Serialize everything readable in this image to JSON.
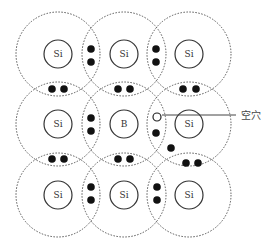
{
  "diagram": {
    "type": "boron-doped silicon lattice (P-type semiconductor)",
    "colors": {
      "background": "#ffffff",
      "line": "#333333",
      "dotted": "#555555",
      "electron": "#111111"
    },
    "atoms": [
      {
        "row": 0,
        "col": 0,
        "label": "Si",
        "x": 58,
        "y": 54
      },
      {
        "row": 0,
        "col": 1,
        "label": "Si",
        "x": 124,
        "y": 54
      },
      {
        "row": 0,
        "col": 2,
        "label": "Si",
        "x": 189,
        "y": 54
      },
      {
        "row": 1,
        "col": 0,
        "label": "Si",
        "x": 58,
        "y": 124
      },
      {
        "row": 1,
        "col": 1,
        "label": "B",
        "x": 124,
        "y": 124
      },
      {
        "row": 1,
        "col": 2,
        "label": "Si",
        "x": 189,
        "y": 124
      },
      {
        "row": 2,
        "col": 0,
        "label": "Si",
        "x": 58,
        "y": 195
      },
      {
        "row": 2,
        "col": 1,
        "label": "Si",
        "x": 124,
        "y": 195
      },
      {
        "row": 2,
        "col": 2,
        "label": "Si",
        "x": 189,
        "y": 195
      }
    ],
    "inner_radius": 14,
    "outer_radius": 42,
    "electrons": [
      {
        "x": 91,
        "y": 49
      },
      {
        "x": 91,
        "y": 62
      },
      {
        "x": 156,
        "y": 49
      },
      {
        "x": 156,
        "y": 62
      },
      {
        "x": 52,
        "y": 89
      },
      {
        "x": 64,
        "y": 89
      },
      {
        "x": 118,
        "y": 89
      },
      {
        "x": 130,
        "y": 89
      },
      {
        "x": 183,
        "y": 89
      },
      {
        "x": 196,
        "y": 89
      },
      {
        "x": 91,
        "y": 118
      },
      {
        "x": 91,
        "y": 131
      },
      {
        "x": 156,
        "y": 133
      },
      {
        "x": 171,
        "y": 148
      },
      {
        "x": 52,
        "y": 159
      },
      {
        "x": 64,
        "y": 159
      },
      {
        "x": 118,
        "y": 159
      },
      {
        "x": 130,
        "y": 159
      },
      {
        "x": 186,
        "y": 163
      },
      {
        "x": 198,
        "y": 163
      },
      {
        "x": 91,
        "y": 187
      },
      {
        "x": 91,
        "y": 200
      },
      {
        "x": 157,
        "y": 187
      },
      {
        "x": 157,
        "y": 200
      }
    ],
    "hole": {
      "x": 157,
      "y": 117,
      "label": "空穴"
    },
    "callout": {
      "x1": 162,
      "y1": 115,
      "x2": 236,
      "y2": 115,
      "label_x": 241,
      "label_y": 119
    }
  }
}
